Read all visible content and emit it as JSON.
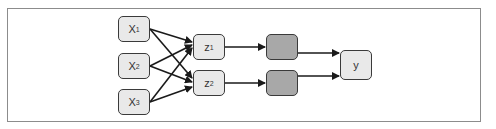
{
  "diagram": {
    "colors": {
      "frame_border": "#8c8c8c",
      "node_light_fill": "#e9e9e9",
      "node_dark_fill": "#a8a8a8",
      "node_border": "#3a3a3a",
      "edge": "#1a1a1a"
    },
    "inputs": [
      {
        "id": "x1",
        "label": "X",
        "sub": "1"
      },
      {
        "id": "x2",
        "label": "X",
        "sub": "2"
      },
      {
        "id": "x3",
        "label": "X",
        "sub": "3"
      }
    ],
    "hidden": [
      {
        "id": "z1",
        "label": "z",
        "sub": "1"
      },
      {
        "id": "z2",
        "label": "z",
        "sub": "2"
      }
    ],
    "activations": [
      {
        "id": "a1",
        "label": ""
      },
      {
        "id": "a2",
        "label": ""
      }
    ],
    "output": {
      "id": "y",
      "label": "y"
    },
    "edges": [
      [
        "x1",
        "z1"
      ],
      [
        "x1",
        "z2"
      ],
      [
        "x2",
        "z1"
      ],
      [
        "x2",
        "z2"
      ],
      [
        "x3",
        "z1"
      ],
      [
        "x3",
        "z2"
      ],
      [
        "z1",
        "a1"
      ],
      [
        "z2",
        "a2"
      ],
      [
        "a1",
        "y"
      ],
      [
        "a2",
        "y"
      ]
    ]
  }
}
